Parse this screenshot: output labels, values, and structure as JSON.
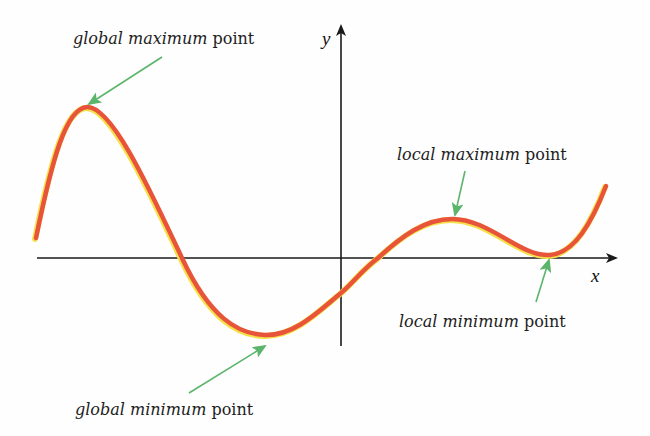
{
  "diagram": {
    "axes": {
      "x_label": "x",
      "y_label": "y"
    },
    "labels": {
      "global_max": {
        "emph": "global maximum",
        "rest": " point"
      },
      "local_max": {
        "emph": "local maximum",
        "rest": " point"
      },
      "global_min": {
        "emph": "global minimum",
        "rest": " point"
      },
      "local_min": {
        "emph": "local minimum",
        "rest": " point"
      }
    },
    "colors": {
      "curve": "#e8543a",
      "curve_highlight": "#f5e04a",
      "arrow": "#5bb56a",
      "axis": "#1a1a1a",
      "text": "#1d1d1d"
    }
  }
}
